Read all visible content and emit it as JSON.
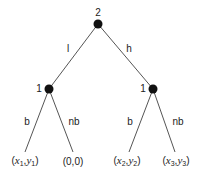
{
  "diagram": {
    "type": "game-tree",
    "root": {
      "player": "2",
      "x": 98,
      "y": 24
    },
    "decision_nodes": [
      {
        "player": "1",
        "x": 49,
        "y": 89
      },
      {
        "player": "1",
        "x": 153,
        "y": 89
      }
    ],
    "root_edges": [
      {
        "label": "l",
        "to": 0
      },
      {
        "label": "h",
        "to": 1
      }
    ],
    "leaf_edges": [
      {
        "label": "b",
        "from": 0,
        "leaf": 0
      },
      {
        "label": "nb",
        "from": 0,
        "leaf": 1
      },
      {
        "label": "b",
        "from": 1,
        "leaf": 2
      },
      {
        "label": "nb",
        "from": 1,
        "leaf": 3
      }
    ],
    "leaves": [
      {
        "payoff": "(x1,y1)",
        "a": "x",
        "ai": "1",
        "b": "y",
        "bi": "1",
        "x": 25
      },
      {
        "payoff": "(0,0)",
        "x": 73
      },
      {
        "payoff": "(x2,y2)",
        "a": "x",
        "ai": "2",
        "b": "y",
        "bi": "2",
        "x": 127
      },
      {
        "payoff": "(x3,y3)",
        "a": "x",
        "ai": "3",
        "b": "y",
        "bi": "3",
        "x": 174
      }
    ]
  }
}
